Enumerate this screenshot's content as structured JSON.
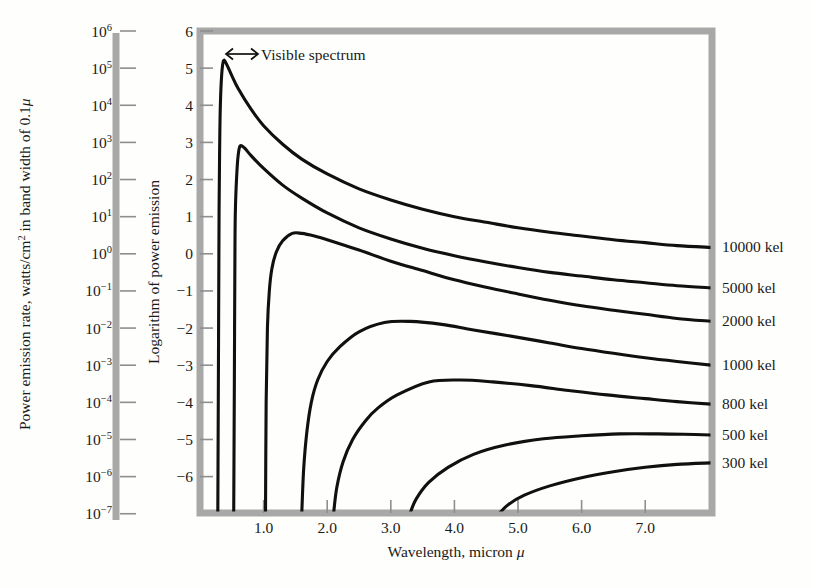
{
  "figure": {
    "name": "blackbody-power-emission-chart",
    "background_color": "#fefefc",
    "frame_color": "#a8a8a8",
    "curve_color": "#101010"
  },
  "annotation": {
    "visible_spectrum": "Visible spectrum",
    "arrow_icon": "double-headed-arrow-icon"
  },
  "left_axis": {
    "title": "Power emission rate, watts/cm² in band width of 0.1μ",
    "title_parts": {
      "pre": "Power emission rate, watts/cm",
      "sup": "2",
      "post": " in band width of 0.1",
      "mu": "μ"
    },
    "tick_labels": [
      {
        "mantissa": "10",
        "exponent": "6"
      },
      {
        "mantissa": "10",
        "exponent": "5"
      },
      {
        "mantissa": "10",
        "exponent": "4"
      },
      {
        "mantissa": "10",
        "exponent": "3"
      },
      {
        "mantissa": "10",
        "exponent": "2"
      },
      {
        "mantissa": "10",
        "exponent": "1"
      },
      {
        "mantissa": "10",
        "exponent": "0"
      },
      {
        "mantissa": "10",
        "exponent": "−1"
      },
      {
        "mantissa": "10",
        "exponent": "−2"
      },
      {
        "mantissa": "10",
        "exponent": "−3"
      },
      {
        "mantissa": "10",
        "exponent": "−4"
      },
      {
        "mantissa": "10",
        "exponent": "−5"
      },
      {
        "mantissa": "10",
        "exponent": "−6"
      },
      {
        "mantissa": "10",
        "exponent": "−7"
      }
    ]
  },
  "y_axis": {
    "title": "Logarithm of power emission",
    "tick_labels": [
      "6",
      "5",
      "4",
      "3",
      "2",
      "1",
      "0",
      "−1",
      "−2",
      "−3",
      "−4",
      "−5",
      "−6"
    ]
  },
  "x_axis": {
    "title": "Wavelength, micron μ",
    "title_parts": {
      "pre": "Wavelength, micron ",
      "mu": "μ"
    },
    "tick_labels": [
      "1.0",
      "2.0",
      "3.0",
      "4.0",
      "5.0",
      "6.0",
      "7.0"
    ]
  },
  "curve_labels": [
    "10000 kel",
    "5000 kel",
    "2000 kel",
    "1000 kel",
    "800 kel",
    "500 kel",
    "300 kel"
  ],
  "chart_data": {
    "type": "line",
    "title": "",
    "xlabel": "Wavelength, micron μ",
    "ylabel": "Logarithm of power emission",
    "y2label": "Power emission rate, watts/cm² in band width of 0.1μ",
    "xlim": [
      0.0,
      8.05
    ],
    "ylim": [
      -6.98,
      6.0
    ],
    "xticks": [
      1.0,
      2.0,
      3.0,
      4.0,
      5.0,
      6.0,
      7.0
    ],
    "yticks": [
      6,
      5,
      4,
      3,
      2,
      1,
      0,
      -1,
      -2,
      -3,
      -4,
      -5,
      -6
    ],
    "y2ticks": [
      1000000,
      100000,
      10000,
      1000,
      100,
      10,
      1,
      0.1,
      0.01,
      0.001,
      0.0001,
      1e-05,
      1e-06,
      1e-07
    ],
    "grid": false,
    "legend_position": "right-inline-labels",
    "annotations": [
      {
        "text": "Visible spectrum",
        "x_range": [
          0.38,
          0.78
        ],
        "y": 5.85,
        "arrow": "double-headed"
      }
    ],
    "series": [
      {
        "name": "10000 kel",
        "color": "#101010",
        "peak": {
          "x": 0.37,
          "y": 5.2
        },
        "points": [
          [
            0.28,
            -7.0
          ],
          [
            0.29,
            -3.0
          ],
          [
            0.3,
            1.2
          ],
          [
            0.31,
            3.0
          ],
          [
            0.32,
            4.0
          ],
          [
            0.34,
            4.8
          ],
          [
            0.37,
            5.2
          ],
          [
            0.42,
            5.1
          ],
          [
            0.5,
            4.8
          ],
          [
            0.6,
            4.45
          ],
          [
            0.8,
            3.9
          ],
          [
            1.0,
            3.45
          ],
          [
            1.3,
            2.95
          ],
          [
            1.6,
            2.55
          ],
          [
            2.0,
            2.15
          ],
          [
            2.5,
            1.75
          ],
          [
            3.0,
            1.45
          ],
          [
            3.5,
            1.2
          ],
          [
            4.0,
            1.0
          ],
          [
            4.5,
            0.85
          ],
          [
            5.0,
            0.7
          ],
          [
            5.5,
            0.58
          ],
          [
            6.0,
            0.48
          ],
          [
            6.5,
            0.38
          ],
          [
            7.0,
            0.3
          ],
          [
            7.5,
            0.22
          ],
          [
            8.05,
            0.17
          ]
        ]
      },
      {
        "name": "5000 kel",
        "color": "#101010",
        "peak": {
          "x": 0.63,
          "y": 2.9
        },
        "points": [
          [
            0.53,
            -7.0
          ],
          [
            0.54,
            -3.5
          ],
          [
            0.55,
            0.3
          ],
          [
            0.56,
            1.4
          ],
          [
            0.58,
            2.2
          ],
          [
            0.6,
            2.65
          ],
          [
            0.63,
            2.9
          ],
          [
            0.7,
            2.85
          ],
          [
            0.8,
            2.65
          ],
          [
            1.0,
            2.3
          ],
          [
            1.3,
            1.85
          ],
          [
            1.6,
            1.5
          ],
          [
            2.0,
            1.1
          ],
          [
            2.5,
            0.7
          ],
          [
            3.0,
            0.4
          ],
          [
            3.5,
            0.15
          ],
          [
            4.0,
            -0.05
          ],
          [
            4.5,
            -0.22
          ],
          [
            5.0,
            -0.37
          ],
          [
            5.5,
            -0.5
          ],
          [
            6.0,
            -0.6
          ],
          [
            6.5,
            -0.7
          ],
          [
            7.0,
            -0.78
          ],
          [
            7.5,
            -0.86
          ],
          [
            8.05,
            -0.92
          ]
        ]
      },
      {
        "name": "2000 kel",
        "color": "#101010",
        "peak": {
          "x": 1.45,
          "y": 0.55
        },
        "points": [
          [
            1.03,
            -7.0
          ],
          [
            1.04,
            -4.0
          ],
          [
            1.06,
            -2.0
          ],
          [
            1.09,
            -1.0
          ],
          [
            1.13,
            -0.4
          ],
          [
            1.2,
            0.05
          ],
          [
            1.3,
            0.35
          ],
          [
            1.45,
            0.55
          ],
          [
            1.6,
            0.55
          ],
          [
            1.8,
            0.48
          ],
          [
            2.0,
            0.38
          ],
          [
            2.5,
            0.1
          ],
          [
            3.0,
            -0.2
          ],
          [
            3.5,
            -0.45
          ],
          [
            4.0,
            -0.7
          ],
          [
            4.5,
            -0.9
          ],
          [
            5.0,
            -1.08
          ],
          [
            5.5,
            -1.25
          ],
          [
            6.0,
            -1.4
          ],
          [
            6.5,
            -1.52
          ],
          [
            7.0,
            -1.63
          ],
          [
            7.5,
            -1.74
          ],
          [
            8.05,
            -1.82
          ]
        ]
      },
      {
        "name": "1000 kel",
        "color": "#101010",
        "peak": {
          "x": 2.9,
          "y": -1.85
        },
        "points": [
          [
            1.6,
            -7.0
          ],
          [
            1.63,
            -5.8
          ],
          [
            1.68,
            -4.8
          ],
          [
            1.75,
            -4.0
          ],
          [
            1.85,
            -3.4
          ],
          [
            2.0,
            -2.9
          ],
          [
            2.2,
            -2.5
          ],
          [
            2.5,
            -2.1
          ],
          [
            2.9,
            -1.85
          ],
          [
            3.3,
            -1.82
          ],
          [
            3.8,
            -1.9
          ],
          [
            4.3,
            -2.05
          ],
          [
            5.0,
            -2.25
          ],
          [
            5.5,
            -2.4
          ],
          [
            6.0,
            -2.55
          ],
          [
            6.5,
            -2.68
          ],
          [
            7.0,
            -2.8
          ],
          [
            7.5,
            -2.9
          ],
          [
            8.05,
            -3.0
          ]
        ]
      },
      {
        "name": "800 kel",
        "color": "#101010",
        "peak": {
          "x": 3.6,
          "y": -3.45
        },
        "points": [
          [
            2.1,
            -7.0
          ],
          [
            2.15,
            -6.3
          ],
          [
            2.25,
            -5.6
          ],
          [
            2.4,
            -5.0
          ],
          [
            2.6,
            -4.5
          ],
          [
            2.8,
            -4.15
          ],
          [
            3.1,
            -3.8
          ],
          [
            3.6,
            -3.45
          ],
          [
            4.1,
            -3.4
          ],
          [
            4.6,
            -3.45
          ],
          [
            5.2,
            -3.55
          ],
          [
            5.8,
            -3.68
          ],
          [
            6.4,
            -3.8
          ],
          [
            7.0,
            -3.9
          ],
          [
            7.5,
            -3.98
          ],
          [
            8.05,
            -4.05
          ]
        ]
      },
      {
        "name": "500 kel",
        "color": "#101010",
        "peak": {
          "x": 6.6,
          "y": -4.85
        },
        "points": [
          [
            3.3,
            -7.0
          ],
          [
            3.4,
            -6.6
          ],
          [
            3.6,
            -6.15
          ],
          [
            3.9,
            -5.75
          ],
          [
            4.3,
            -5.4
          ],
          [
            4.8,
            -5.15
          ],
          [
            5.4,
            -4.98
          ],
          [
            6.0,
            -4.9
          ],
          [
            6.6,
            -4.85
          ],
          [
            7.2,
            -4.85
          ],
          [
            7.6,
            -4.86
          ],
          [
            8.05,
            -4.88
          ]
        ]
      },
      {
        "name": "300 kel",
        "color": "#101010",
        "peak": {
          "x": 7.5,
          "y": -5.65
        },
        "points": [
          [
            4.7,
            -7.0
          ],
          [
            4.85,
            -6.75
          ],
          [
            5.1,
            -6.5
          ],
          [
            5.5,
            -6.25
          ],
          [
            6.0,
            -6.03
          ],
          [
            6.5,
            -5.87
          ],
          [
            7.0,
            -5.75
          ],
          [
            7.5,
            -5.67
          ],
          [
            8.05,
            -5.63
          ]
        ]
      }
    ]
  }
}
